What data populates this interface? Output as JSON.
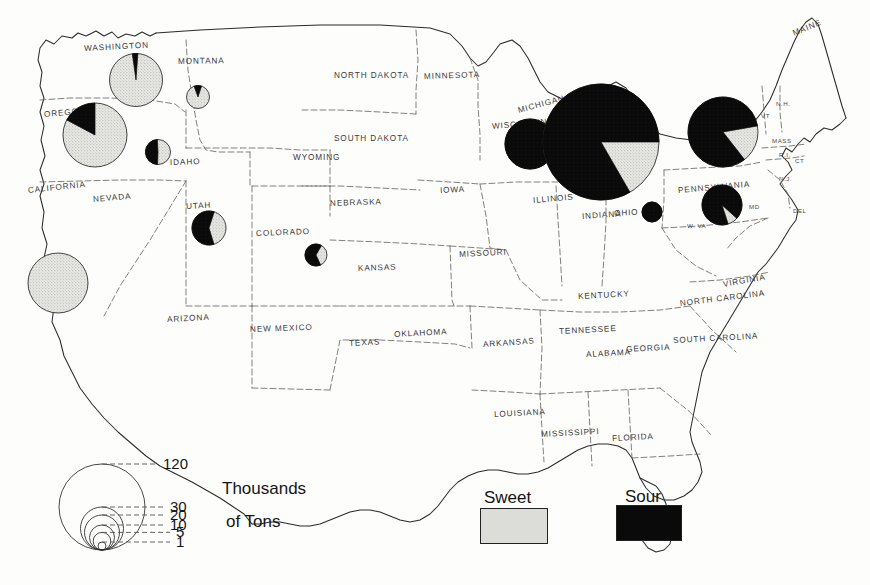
{
  "map": {
    "title": "United States cherry production by state",
    "units_label_line1": "Thousands",
    "units_label_line2": "of  Tons",
    "colors": {
      "sweet": "#dcdcd8",
      "sour": "#0a0a0a",
      "outline": "#2b2b2b",
      "state_border": "#555555",
      "label": "#3a3a3a",
      "background": "#fdfdfc"
    },
    "state_labels": [
      {
        "name": "WASHINGTON",
        "x": 84,
        "y": 44,
        "rot": -3
      },
      {
        "name": "MONTANA",
        "x": 178,
        "y": 57,
        "rot": -1
      },
      {
        "name": "NORTH DAKOTA",
        "x": 334,
        "y": 71,
        "rot": 0
      },
      {
        "name": "MINNESOTA",
        "x": 424,
        "y": 72,
        "rot": -2
      },
      {
        "name": "MAINE",
        "x": 793,
        "y": 29,
        "rot": -22
      },
      {
        "name": "OREGON",
        "x": 44,
        "y": 110,
        "rot": -5
      },
      {
        "name": "IDAHO",
        "x": 170,
        "y": 158,
        "rot": -2
      },
      {
        "name": "SOUTH DAKOTA",
        "x": 334,
        "y": 134,
        "rot": 0
      },
      {
        "name": "WYOMING",
        "x": 293,
        "y": 153,
        "rot": 0
      },
      {
        "name": "WISCONSIN",
        "x": 492,
        "y": 122,
        "rot": -5
      },
      {
        "name": "MICHIGAN",
        "x": 518,
        "y": 106,
        "rot": -15
      },
      {
        "name": "CALIFORNIA",
        "x": 28,
        "y": 186,
        "rot": -6
      },
      {
        "name": "NEVADA",
        "x": 93,
        "y": 195,
        "rot": -5
      },
      {
        "name": "UTAH",
        "x": 186,
        "y": 202,
        "rot": -3
      },
      {
        "name": "COLORADO",
        "x": 256,
        "y": 229,
        "rot": -2
      },
      {
        "name": "NEBRASKA",
        "x": 330,
        "y": 199,
        "rot": -2
      },
      {
        "name": "IOWA",
        "x": 440,
        "y": 186,
        "rot": -3
      },
      {
        "name": "ILLINOIS",
        "x": 533,
        "y": 196,
        "rot": -5
      },
      {
        "name": "INDIANA",
        "x": 582,
        "y": 212,
        "rot": -4
      },
      {
        "name": "OHIO",
        "x": 614,
        "y": 209,
        "rot": -3
      },
      {
        "name": "PENNSYLVANIA",
        "x": 678,
        "y": 186,
        "rot": -5
      },
      {
        "name": "MISSOURI",
        "x": 459,
        "y": 250,
        "rot": -3
      },
      {
        "name": "KANSAS",
        "x": 358,
        "y": 264,
        "rot": -2
      },
      {
        "name": "ARIZONA",
        "x": 167,
        "y": 315,
        "rot": -3
      },
      {
        "name": "NEW MEXICO",
        "x": 250,
        "y": 325,
        "rot": -2
      },
      {
        "name": "TEXAS",
        "x": 349,
        "y": 339,
        "rot": -3
      },
      {
        "name": "OKLAHOMA",
        "x": 394,
        "y": 330,
        "rot": -3
      },
      {
        "name": "ARKANSAS",
        "x": 483,
        "y": 340,
        "rot": -4
      },
      {
        "name": "KENTUCKY",
        "x": 578,
        "y": 292,
        "rot": -3
      },
      {
        "name": "TENNESSEE",
        "x": 559,
        "y": 327,
        "rot": -3
      },
      {
        "name": "VIRGINIA",
        "x": 723,
        "y": 280,
        "rot": -10
      },
      {
        "name": "NORTH CAROLINA",
        "x": 680,
        "y": 299,
        "rot": -7
      },
      {
        "name": "SOUTH CAROLINA",
        "x": 673,
        "y": 336,
        "rot": -3
      },
      {
        "name": "GEORGIA",
        "x": 626,
        "y": 345,
        "rot": -3
      },
      {
        "name": "ALABAMA",
        "x": 586,
        "y": 350,
        "rot": -3
      },
      {
        "name": "MISSISSIPPI",
        "x": 541,
        "y": 430,
        "rot": -3
      },
      {
        "name": "LOUISIANA",
        "x": 494,
        "y": 410,
        "rot": -3
      },
      {
        "name": "FLORIDA",
        "x": 612,
        "y": 434,
        "rot": -3
      }
    ],
    "abbr_labels": [
      {
        "name": "N.H.",
        "x": 776,
        "y": 100
      },
      {
        "name": "VT",
        "x": 761,
        "y": 112
      },
      {
        "name": "MASS",
        "x": 772,
        "y": 137
      },
      {
        "name": "R.I.",
        "x": 779,
        "y": 151
      },
      {
        "name": "CT",
        "x": 795,
        "y": 157
      },
      {
        "name": "N.J.",
        "x": 779,
        "y": 175
      },
      {
        "name": "DEL",
        "x": 793,
        "y": 207
      },
      {
        "name": "MD",
        "x": 749,
        "y": 203
      },
      {
        "name": "W. VA",
        "x": 687,
        "y": 222
      }
    ],
    "pies": [
      {
        "state": "Washington",
        "cx": 136,
        "cy": 80,
        "r": 26.5,
        "sour_deg": 12,
        "start_deg": -8,
        "sweet_pct": 96.7,
        "sour_pct": 3.3
      },
      {
        "state": "Montana",
        "cx": 198,
        "cy": 97,
        "r": 11.5,
        "sour_deg": 38,
        "start_deg": -20,
        "sweet_pct": 89.4,
        "sour_pct": 10.6
      },
      {
        "state": "Oregon",
        "cx": 95,
        "cy": 135,
        "r": 32,
        "sour_deg": 62,
        "start_deg": -62,
        "sweet_pct": 82.8,
        "sour_pct": 17.2
      },
      {
        "state": "Idaho",
        "cx": 158,
        "cy": 152,
        "r": 12.5,
        "sour_deg": 175,
        "start_deg": -178,
        "sweet_pct": 51.4,
        "sour_pct": 48.6
      },
      {
        "state": "California",
        "cx": 58,
        "cy": 283,
        "r": 30,
        "sour_deg": 0,
        "start_deg": 0,
        "sweet_pct": 100,
        "sour_pct": 0
      },
      {
        "state": "Utah",
        "cx": 209,
        "cy": 228,
        "r": 17,
        "sour_deg": 215,
        "start_deg": -197,
        "sweet_pct": 40.3,
        "sour_pct": 59.7
      },
      {
        "state": "Colorado",
        "cx": 316,
        "cy": 255,
        "r": 11,
        "sour_deg": 235,
        "start_deg": -205,
        "sweet_pct": 34.7,
        "sour_pct": 65.3
      },
      {
        "state": "Wisconsin",
        "cx": 530,
        "cy": 144,
        "r": 25,
        "sour_deg": 360,
        "start_deg": 0,
        "sweet_pct": 0,
        "sour_pct": 100
      },
      {
        "state": "Michigan",
        "cx": 601,
        "cy": 142,
        "r": 58,
        "sour_deg": 300,
        "start_deg": 150,
        "sweet_pct": 16.7,
        "sour_pct": 83.3
      },
      {
        "state": "Ohio",
        "cx": 652,
        "cy": 212,
        "r": 10,
        "sour_deg": 360,
        "start_deg": 0,
        "sweet_pct": 0,
        "sour_pct": 100
      },
      {
        "state": "New York",
        "cx": 723,
        "cy": 132,
        "r": 35,
        "sour_deg": 298,
        "start_deg": 142,
        "sweet_pct": 17.2,
        "sour_pct": 82.8
      },
      {
        "state": "Pennsylvania",
        "cx": 722,
        "cy": 205,
        "r": 20,
        "sour_deg": 330,
        "start_deg": 162,
        "sweet_pct": 8.3,
        "sour_pct": 91.7
      }
    ],
    "legend": {
      "circles": [
        {
          "value": "120",
          "r": 43,
          "label_x": 163,
          "label_y": 447
        },
        {
          "value": "30",
          "r": 21.5,
          "label_x": 170,
          "label_y": 486
        },
        {
          "value": "20",
          "r": 17.5,
          "label_x": 170,
          "label_y": 499
        },
        {
          "value": "10",
          "r": 12.5,
          "label_x": 170,
          "label_y": 512
        },
        {
          "value": "5",
          "r": 8.8,
          "label_x": 176,
          "label_y": 523
        },
        {
          "value": "1",
          "r": 4.0,
          "label_x": 176,
          "label_y": 543
        }
      ],
      "anchor_x": 102,
      "baseline_y": 550
    },
    "keys": [
      {
        "label": "Sweet",
        "fill": "sweet",
        "label_x": 484,
        "label_y": 488,
        "box_x": 480,
        "box_y": 508,
        "box_w": 66,
        "box_h": 34
      },
      {
        "label": "Sour",
        "fill": "sour",
        "label_x": 625,
        "label_y": 487,
        "box_x": 616,
        "box_y": 505,
        "box_w": 64,
        "box_h": 34
      }
    ]
  },
  "chart_data": {
    "type": "pie",
    "units": "Thousands of Tons",
    "legend_entries": [
      "Sweet",
      "Sour"
    ],
    "size_legend_values": [
      120,
      30,
      20,
      10,
      5,
      1
    ],
    "series": [
      {
        "name": "Sweet",
        "color": "#dcdcd8"
      },
      {
        "name": "Sour",
        "color": "#0a0a0a"
      }
    ],
    "categories": [
      "Washington",
      "Montana",
      "Oregon",
      "Idaho",
      "California",
      "Utah",
      "Colorado",
      "Wisconsin",
      "Michigan",
      "Ohio",
      "New York",
      "Pennsylvania"
    ],
    "values": [
      {
        "state": "Washington",
        "total": 55,
        "sweet_pct": 96.7,
        "sour_pct": 3.3
      },
      {
        "state": "Montana",
        "total": 4,
        "sweet_pct": 89.4,
        "sour_pct": 10.6
      },
      {
        "state": "Oregon",
        "total": 72,
        "sweet_pct": 82.8,
        "sour_pct": 17.2
      },
      {
        "state": "Idaho",
        "total": 5,
        "sweet_pct": 51.4,
        "sour_pct": 48.6
      },
      {
        "state": "California",
        "total": 62,
        "sweet_pct": 100,
        "sour_pct": 0
      },
      {
        "state": "Utah",
        "total": 12,
        "sweet_pct": 40.3,
        "sour_pct": 59.7
      },
      {
        "state": "Colorado",
        "total": 4,
        "sweet_pct": 34.7,
        "sour_pct": 65.3
      },
      {
        "state": "Wisconsin",
        "total": 30,
        "sweet_pct": 0,
        "sour_pct": 100
      },
      {
        "state": "Michigan",
        "total": 180,
        "sweet_pct": 16.7,
        "sour_pct": 83.3
      },
      {
        "state": "Ohio",
        "total": 3,
        "sweet_pct": 0,
        "sour_pct": 100
      },
      {
        "state": "New York",
        "total": 75,
        "sweet_pct": 17.2,
        "sour_pct": 82.8
      },
      {
        "state": "Pennsylvania",
        "total": 20,
        "sweet_pct": 8.3,
        "sour_pct": 91.7
      }
    ],
    "xlabel": "",
    "ylabel": "",
    "grid": false,
    "legend_position": "bottom-center"
  }
}
